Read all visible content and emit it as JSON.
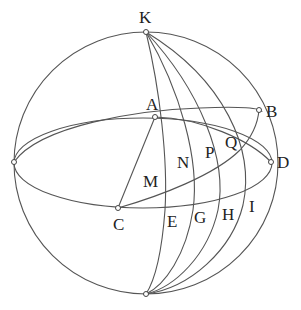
{
  "figure": {
    "type": "spherical geometry diagram"
  },
  "points": {
    "K": {
      "label": "K",
      "x": 146,
      "y": 32
    },
    "bottom": {
      "label": "",
      "x": 146,
      "y": 294
    },
    "left": {
      "label": "",
      "x": 14,
      "y": 162
    },
    "A": {
      "label": "A",
      "x": 155,
      "y": 117
    },
    "B": {
      "label": "B",
      "x": 259,
      "y": 110
    },
    "C": {
      "label": "C",
      "x": 118,
      "y": 208
    },
    "D": {
      "label": "D",
      "x": 271,
      "y": 162
    }
  },
  "labels": {
    "K": "K",
    "A": "A",
    "B": "B",
    "C": "C",
    "D": "D",
    "M": "M",
    "N": "N",
    "P": "P",
    "Q": "Q",
    "E": "E",
    "G": "G",
    "H": "H",
    "I": "I"
  }
}
